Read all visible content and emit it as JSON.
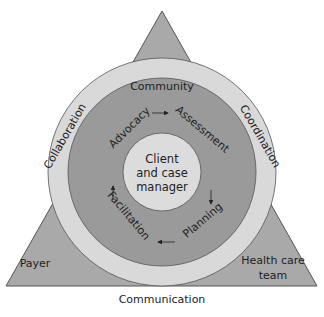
{
  "diagram": {
    "corners": {
      "top": "Community",
      "left": "Payer",
      "right_line1": "Health care",
      "right_line2": "team"
    },
    "edges": {
      "left": "Collaboration",
      "right": "Coordination",
      "bottom": "Communication"
    },
    "cycle": {
      "steps": [
        "Advocacy",
        "Assessment",
        "Planning",
        "Facilitation"
      ]
    },
    "center": {
      "line1": "Client",
      "line2": "and case",
      "line3": "manager"
    },
    "colors": {
      "triangle": "#a9a9a9",
      "outer_ring": "#d9d9d9",
      "process_ring": "#9a9a9a",
      "center": "#dcdcdc",
      "stroke": "#444444"
    }
  }
}
